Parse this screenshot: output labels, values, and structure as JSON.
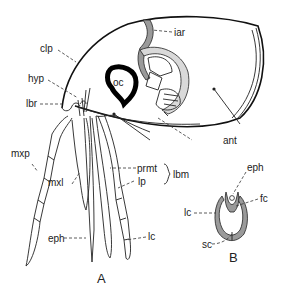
{
  "figure": {
    "panels": [
      {
        "id": "A",
        "label": "A",
        "labels": {
          "clp": "clp",
          "hyp": "hyp",
          "lbr": "lbr",
          "iar": "iar",
          "oc": "oc",
          "ant": "ant",
          "mxp": "mxp",
          "mxl": "mxl",
          "prmt": "prmt",
          "lp": "lp",
          "lbm": "lbm",
          "eph": "eph",
          "lc": "lc"
        }
      },
      {
        "id": "B",
        "label": "B",
        "labels": {
          "eph": "eph",
          "fc": "fc",
          "lc": "lc",
          "sc": "sc"
        }
      }
    ]
  }
}
